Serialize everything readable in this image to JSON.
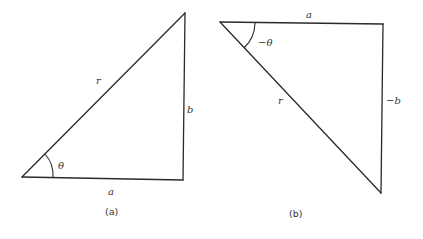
{
  "diagram": {
    "panels": [
      {
        "caption": "(a)",
        "labels": {
          "hypotenuse": "r",
          "vertical": "b",
          "horizontal": "a",
          "angle": "θ"
        }
      },
      {
        "caption": "(b)",
        "labels": {
          "hypotenuse": "r",
          "vertical": "−b",
          "horizontal": "a",
          "angle": "−θ"
        }
      }
    ]
  }
}
